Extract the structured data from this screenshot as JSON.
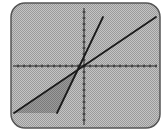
{
  "screen": {
    "type": "graphing-calculator-display",
    "background": "#b8b8b8",
    "frame_color": "#555555",
    "frame": {
      "x": 11,
      "y": 3,
      "width": 149,
      "height": 125,
      "radius": 14
    }
  },
  "axes": {
    "origin": {
      "x": 84,
      "y": 66
    },
    "x_axis": {
      "x1": 13,
      "x2": 157,
      "y": 66,
      "tick_spacing": 6
    },
    "y_axis": {
      "x": 84,
      "y1": 8,
      "y2": 125,
      "tick_spacing": 6
    },
    "color": "#222222"
  },
  "chart_data": {
    "type": "line",
    "title": "",
    "xlabel": "",
    "ylabel": "",
    "grid": false,
    "series": [
      {
        "name": "steep-line",
        "color": "#1a1a1a",
        "points_px": [
          [
            57,
            113
          ],
          [
            103,
            17
          ]
        ]
      },
      {
        "name": "shallow-line",
        "color": "#1a1a1a",
        "points_px": [
          [
            14,
            113
          ],
          [
            156,
            17
          ]
        ]
      }
    ],
    "shaded_region": {
      "fill": "#8f8f8f",
      "points_px": [
        [
          14,
          113
        ],
        [
          57,
          113
        ],
        [
          80,
          68
        ]
      ]
    }
  }
}
